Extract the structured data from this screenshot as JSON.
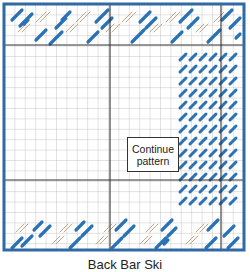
{
  "diagram": {
    "callout": {
      "line1": "Continue",
      "line2": "pattern"
    },
    "caption": "Back Bar Ski",
    "colors": {
      "frame": "#2f6aa6",
      "grid": "#b9b9b9",
      "major_grid": "#333333",
      "stitch_blue": "#2a72b5",
      "stitch_outline": "#c7a88a"
    },
    "grid": {
      "cell_size": 10.4,
      "cols": 23,
      "rows": 24
    },
    "regions": [
      {
        "name": "top-border-band",
        "rows": "1-4",
        "fill": "diagonal blue and outlined stitches"
      },
      {
        "name": "bottom-border-band",
        "rows": "20-23",
        "fill": "diagonal blue and outlined stitches"
      },
      {
        "name": "right-column-band",
        "cols": "18-22",
        "fill": "short diagonal blue stitches"
      }
    ]
  }
}
